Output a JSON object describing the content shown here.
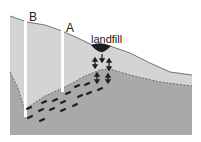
{
  "labels": {
    "well_b": "B",
    "well_a": "A",
    "landfill": "landfill"
  },
  "colors": {
    "background": "#ffffff",
    "unsaturated_zone": "#d4d4d4",
    "saturated_zone": "#a9a9a9",
    "surface_line": "#555555",
    "water_table_line": "#555555",
    "landfill": "#1e1e1e",
    "arrows": "#1e1e1e",
    "wells": "#ffffff"
  },
  "elements": {
    "wells": [
      {
        "name": "B",
        "x": 25,
        "top": 16,
        "bottom": 117
      },
      {
        "name": "A",
        "x": 62,
        "top": 29,
        "bottom": 92
      }
    ],
    "landfill_position": {
      "x": 101,
      "y": 47
    }
  }
}
